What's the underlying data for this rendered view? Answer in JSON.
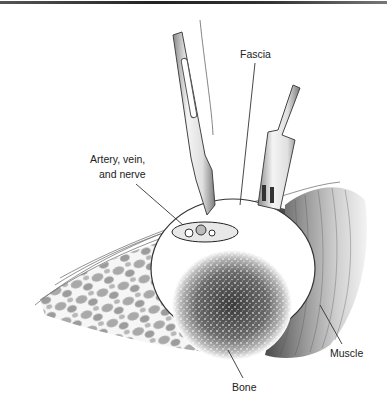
{
  "figure": {
    "labels": {
      "fascia": "Fascia",
      "artery_line1": "Artery, vein,",
      "artery_line2": "and nerve",
      "muscle": "Muscle",
      "bone": "Bone"
    },
    "colors": {
      "background": "#ffffff",
      "ink": "#222222",
      "leader_line": "#333333"
    }
  }
}
